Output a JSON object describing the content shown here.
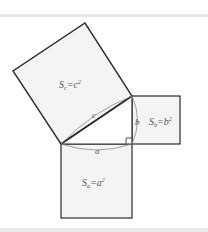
{
  "diagram": {
    "colors": {
      "stroke": "#2b2b2b",
      "fill": "#f4f4f4",
      "arc": "#8a8a8a",
      "label": "#555555",
      "rule": "#e6e6e6"
    },
    "labels": {
      "square_c": {
        "S": "S",
        "sub": "c",
        "eq": "=",
        "var": "c",
        "exp": "2"
      },
      "square_b": {
        "S": "S",
        "sub": "b",
        "eq": "=",
        "var": "b",
        "exp": "2"
      },
      "square_a": {
        "S": "S",
        "sub": "a",
        "eq": "=",
        "var": "a",
        "exp": "2"
      },
      "side_a": "a",
      "side_b": "b",
      "side_c": "c"
    }
  }
}
